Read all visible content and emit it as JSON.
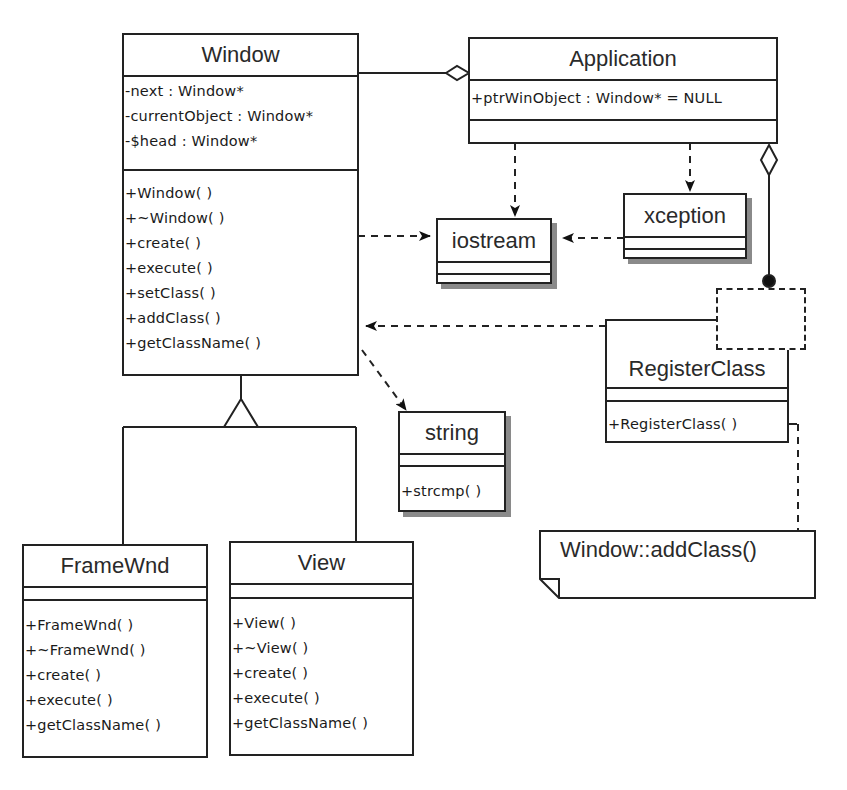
{
  "diagram": {
    "type": "UML class diagram",
    "classes": {
      "window": {
        "name": "Window",
        "attributes": [
          "-next : Window*",
          "-currentObject : Window*",
          "-$head : Window*"
        ],
        "operations": [
          "+Window( )",
          "+~Window( )",
          "+create( )",
          "+execute( )",
          "+setClass( )",
          "+addClass( )",
          "+getClassName( )"
        ]
      },
      "application": {
        "name": "Application",
        "attributes": [
          "+ptrWinObject : Window* = NULL"
        ],
        "operations": []
      },
      "iostream": {
        "name": "iostream",
        "attributes": [],
        "operations": []
      },
      "xception": {
        "name": "xception",
        "attributes": [],
        "operations": []
      },
      "string": {
        "name": "string",
        "attributes": [],
        "operations": [
          "+strcmp( )"
        ]
      },
      "registerclass": {
        "name": "RegisterClass",
        "attributes": [],
        "operations": [
          "+RegisterClass( )"
        ]
      },
      "framewnd": {
        "name": "FrameWnd",
        "attributes": [],
        "operations": [
          "+FrameWnd( )",
          "+~FrameWnd( )",
          "+create( )",
          "+execute( )",
          "+getClassName( )"
        ]
      },
      "view": {
        "name": "View",
        "attributes": [],
        "operations": [
          "+View( )",
          "+~View( )",
          "+create( )",
          "+execute( )",
          "+getClassName( )"
        ]
      }
    },
    "note": {
      "text": "Window::addClass()"
    },
    "relationships": [
      {
        "type": "aggregation",
        "from": "Application",
        "to": "Window"
      },
      {
        "type": "dependency",
        "from": "Window",
        "to": "iostream"
      },
      {
        "type": "dependency",
        "from": "Application",
        "to": "iostream"
      },
      {
        "type": "dependency",
        "from": "Application",
        "to": "xception"
      },
      {
        "type": "dependency",
        "from": "xception",
        "to": "iostream"
      },
      {
        "type": "dependency",
        "from": "Window",
        "to": "string"
      },
      {
        "type": "dependency",
        "from": "RegisterClass",
        "to": "Window"
      },
      {
        "type": "aggregation",
        "from": "Application",
        "to": "RegisterClass"
      },
      {
        "type": "generalization",
        "from": "FrameWnd",
        "to": "Window"
      },
      {
        "type": "generalization",
        "from": "View",
        "to": "Window"
      },
      {
        "type": "note-anchor",
        "from": "RegisterClass",
        "to": "note"
      }
    ],
    "colors": {
      "line": "#222222",
      "shadow": "#8a8a8a",
      "background": "#ffffff"
    }
  }
}
